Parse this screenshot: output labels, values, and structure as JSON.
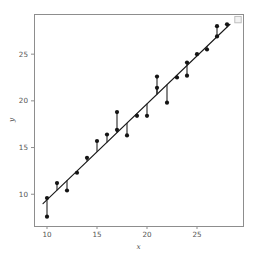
{
  "figure": {
    "background_color": "#ffffff",
    "plot_area": {
      "left": 34,
      "top": 14,
      "right": 243,
      "bottom": 226
    },
    "spine_color": "#8d8d8d",
    "point_color": "#141414",
    "line_color": "#1a1a1a",
    "tick_label_color": "#545454"
  },
  "chart_data": {
    "type": "scatter",
    "title": "",
    "subtitle": "",
    "xlabel": "x",
    "ylabel": "y",
    "xlim": [
      8.7,
      29.6
    ],
    "ylim": [
      6.6,
      29.3
    ],
    "xticks": [
      10,
      15,
      20,
      25
    ],
    "yticks": [
      10,
      15,
      20,
      25
    ],
    "xtick_labels": [
      "10",
      "15",
      "20",
      "25"
    ],
    "ytick_labels": [
      "10",
      "15",
      "20",
      "25"
    ],
    "grid": false,
    "legend": null,
    "legend_position": "none",
    "annotations": [],
    "series": [
      {
        "name": "observations",
        "type": "scatter",
        "marker": "circle",
        "color": "#141414",
        "x": [
          10,
          10,
          11,
          12,
          13,
          14,
          15,
          16,
          17,
          17,
          18,
          19,
          20,
          21,
          21,
          22,
          23,
          24,
          24,
          25,
          26,
          27,
          27,
          28
        ],
        "y": [
          9.6,
          7.6,
          11.2,
          10.4,
          12.3,
          13.9,
          15.7,
          16.4,
          18.8,
          16.9,
          16.3,
          18.4,
          18.4,
          22.6,
          21.4,
          19.8,
          22.5,
          22.7,
          24.1,
          25.0,
          25.5,
          28.0,
          26.9,
          28.2
        ]
      },
      {
        "name": "regression-line",
        "type": "line",
        "color": "#1a1a1a",
        "x": [
          9.6,
          28.3
        ],
        "y": [
          9.0,
          28.2
        ],
        "slope": 1.027,
        "intercept": -0.86
      }
    ],
    "residuals": [
      {
        "x": 10,
        "y_observed": 9.6,
        "y_fitted": 9.41
      },
      {
        "x": 10,
        "y_observed": 7.6,
        "y_fitted": 9.41
      },
      {
        "x": 11,
        "y_observed": 11.2,
        "y_fitted": 10.44
      },
      {
        "x": 12,
        "y_observed": 10.4,
        "y_fitted": 11.47
      },
      {
        "x": 13,
        "y_observed": 12.3,
        "y_fitted": 12.49
      },
      {
        "x": 14,
        "y_observed": 13.9,
        "y_fitted": 13.52
      },
      {
        "x": 15,
        "y_observed": 15.7,
        "y_fitted": 14.55
      },
      {
        "x": 16,
        "y_observed": 16.4,
        "y_fitted": 15.57
      },
      {
        "x": 17,
        "y_observed": 18.8,
        "y_fitted": 16.6
      },
      {
        "x": 17,
        "y_observed": 16.9,
        "y_fitted": 16.6
      },
      {
        "x": 18,
        "y_observed": 16.3,
        "y_fitted": 17.63
      },
      {
        "x": 19,
        "y_observed": 18.4,
        "y_fitted": 18.65
      },
      {
        "x": 20,
        "y_observed": 18.4,
        "y_fitted": 19.68
      },
      {
        "x": 21,
        "y_observed": 22.6,
        "y_fitted": 20.71
      },
      {
        "x": 21,
        "y_observed": 21.4,
        "y_fitted": 20.71
      },
      {
        "x": 22,
        "y_observed": 19.8,
        "y_fitted": 21.73
      },
      {
        "x": 23,
        "y_observed": 22.5,
        "y_fitted": 22.76
      },
      {
        "x": 24,
        "y_observed": 22.7,
        "y_fitted": 23.79
      },
      {
        "x": 24,
        "y_observed": 24.1,
        "y_fitted": 23.79
      },
      {
        "x": 25,
        "y_observed": 25.0,
        "y_fitted": 24.81
      },
      {
        "x": 26,
        "y_observed": 25.5,
        "y_fitted": 25.84
      },
      {
        "x": 27,
        "y_observed": 28.0,
        "y_fitted": 26.87
      },
      {
        "x": 27,
        "y_observed": 26.9,
        "y_fitted": 26.87
      },
      {
        "x": 28,
        "y_observed": 28.2,
        "y_fitted": 27.89
      }
    ],
    "ghost_marker": {
      "x": 29.1,
      "y": 28.7,
      "shape": "square",
      "fill": "#f2f2f2",
      "stroke": "#b9b9b9"
    }
  }
}
